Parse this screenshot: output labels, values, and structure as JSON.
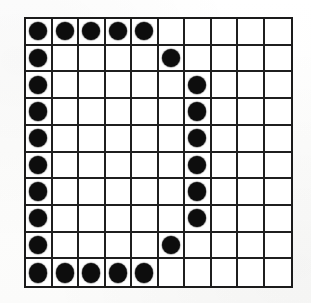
{
  "figure": {
    "name": "dot-matrix-character-grid",
    "caption": "",
    "depicted_character": "D",
    "colors": {
      "dot": "#0d0d0d",
      "gridline": "#1f1f1f",
      "border": "#1b1b1b",
      "cell_background": "#ffffff",
      "page_background": "#fefefe"
    }
  },
  "grid": {
    "rows": 10,
    "columns": 10,
    "row_labels": [
      "1",
      "2",
      "3",
      "4",
      "5",
      "6",
      "7",
      "8",
      "9",
      "10"
    ],
    "column_labels": [
      "1",
      "2",
      "3",
      "4",
      "5",
      "6",
      "7",
      "8",
      "9",
      "10"
    ],
    "on_symbol": "filled-dot",
    "off_symbol": "empty-cell",
    "cells": [
      [
        1,
        1,
        1,
        1,
        1,
        0,
        0,
        0,
        0,
        0
      ],
      [
        1,
        0,
        0,
        0,
        0,
        1,
        0,
        0,
        0,
        0
      ],
      [
        1,
        0,
        0,
        0,
        0,
        0,
        1,
        0,
        0,
        0
      ],
      [
        1,
        0,
        0,
        0,
        0,
        0,
        1,
        0,
        0,
        0
      ],
      [
        1,
        0,
        0,
        0,
        0,
        0,
        1,
        0,
        0,
        0
      ],
      [
        1,
        0,
        0,
        0,
        0,
        0,
        1,
        0,
        0,
        0
      ],
      [
        1,
        0,
        0,
        0,
        0,
        0,
        1,
        0,
        0,
        0
      ],
      [
        1,
        0,
        0,
        0,
        0,
        0,
        1,
        0,
        0,
        0
      ],
      [
        1,
        0,
        0,
        0,
        0,
        1,
        0,
        0,
        0,
        0
      ],
      [
        1,
        1,
        1,
        1,
        1,
        0,
        0,
        0,
        0,
        0
      ]
    ],
    "filled_count": 22,
    "total_cells": 100
  }
}
